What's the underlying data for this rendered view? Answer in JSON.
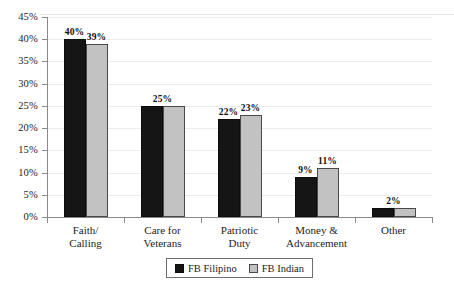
{
  "chart_data": {
    "type": "bar",
    "title": "",
    "subtitle": "",
    "xlabel": "",
    "ylabel": "",
    "categories": [
      "Faith/ Calling",
      "Care for Veterans",
      "Patriotic Duty",
      "Money & Advancement",
      "Other"
    ],
    "category_lines": [
      [
        "Faith/",
        "Calling"
      ],
      [
        "Care for",
        "Veterans"
      ],
      [
        "Patriotic",
        "Duty"
      ],
      [
        "Money &",
        "Advancement"
      ],
      [
        "Other"
      ]
    ],
    "series": [
      {
        "name": "FB Filipino",
        "color": "#151515",
        "values": [
          40,
          25,
          22,
          9,
          2
        ],
        "labels": [
          "40%",
          "25%",
          "22%",
          "9%",
          "2%"
        ]
      },
      {
        "name": "FB Indian",
        "color": "#c2c2c2",
        "values": [
          39,
          25,
          23,
          11,
          2
        ],
        "labels": [
          "39%",
          "25%",
          "23%",
          "11%",
          "2%"
        ]
      }
    ],
    "shared_labels": [
      false,
      true,
      false,
      false,
      true
    ],
    "ylim": [
      0,
      45
    ],
    "ytick_step": 5,
    "ytick_labels": [
      "45%",
      "40%",
      "35%",
      "30%",
      "25%",
      "20%",
      "15%",
      "10%",
      "5%",
      "0%"
    ],
    "ytick_values": [
      45,
      40,
      35,
      30,
      25,
      20,
      15,
      10,
      5,
      0
    ],
    "grid": true,
    "legend_position": "bottom-center",
    "value_label_format": "percent"
  },
  "legend": {
    "entries": [
      {
        "label": "FB Filipino",
        "swatch": "black-square-swatch"
      },
      {
        "label": "FB Indian",
        "swatch": "gray-square-swatch"
      }
    ]
  }
}
